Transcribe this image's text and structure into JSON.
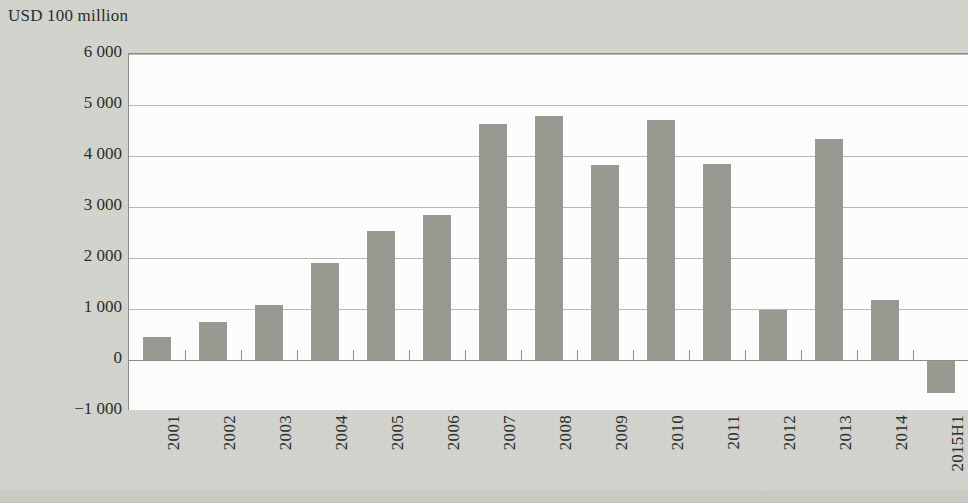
{
  "chart_data": {
    "type": "bar",
    "title": "USD 100 million",
    "subtitle": "",
    "xlabel": "",
    "ylabel": "USD 100 million",
    "categories": [
      "2001",
      "2002",
      "2003",
      "2004",
      "2005",
      "2006",
      "2007",
      "2008",
      "2009",
      "2010",
      "2011",
      "2012",
      "2013",
      "2014",
      "2015H1"
    ],
    "values": [
      460,
      750,
      1070,
      1900,
      2520,
      2850,
      4620,
      4790,
      3830,
      4700,
      3840,
      990,
      4330,
      1170,
      -640
    ],
    "ylim": [
      -1000,
      6000
    ],
    "ytick_values": [
      6000,
      5000,
      4000,
      3000,
      2000,
      1000,
      0,
      -1000
    ],
    "ytick_labels": [
      "6 000",
      "5 000",
      "4 000",
      "3 000",
      "2 000",
      "1 000",
      "0",
      "−1 000"
    ],
    "grid": true,
    "grid_axis": "y",
    "legend": false,
    "legend_position": "none",
    "bar_color": "#9a9a93",
    "gridline_color": "#b8b8b4",
    "axis_color": "#8e8e8a",
    "plot_background": "#ffffff",
    "figure_background": "#d2d5cd",
    "text_color": "#2a2a28",
    "xtick_rotation": 90
  }
}
